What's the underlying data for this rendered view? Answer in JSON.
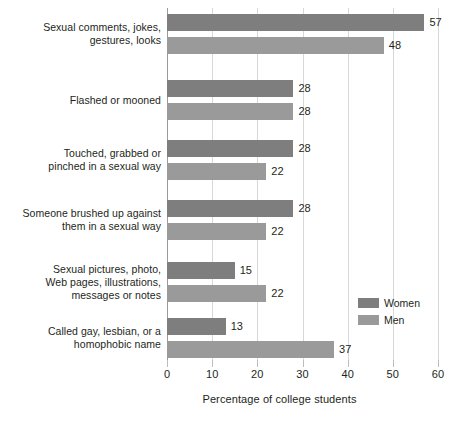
{
  "chart_data": {
    "type": "bar",
    "orientation": "horizontal",
    "title": "",
    "xlabel": "Percentage of college students",
    "ylabel": "",
    "xlim": [
      0,
      60
    ],
    "xticks": [
      0,
      10,
      20,
      30,
      40,
      50,
      60
    ],
    "grid": true,
    "legend_position": "center-right",
    "categories": [
      "Sexual comments, jokes, gestures, looks",
      "Flashed or mooned",
      "Touched, grabbed or pinched in a sexual way",
      "Someone brushed up against them in a sexual way",
      "Sexual pictures, photo, Web pages, illustrations, messages or notes",
      "Called gay, lesbian, or a homophobic name"
    ],
    "category_lines": [
      [
        "Sexual comments, jokes,",
        "gestures, looks"
      ],
      [
        "Flashed or mooned"
      ],
      [
        "Touched, grabbed or",
        "pinched in a sexual way"
      ],
      [
        "Someone brushed up against",
        "them in a sexual way"
      ],
      [
        "Sexual pictures, photo,",
        "Web pages, illustrations,",
        "messages or notes"
      ],
      [
        "Called gay, lesbian, or a",
        "homophobic name"
      ]
    ],
    "series": [
      {
        "name": "Women",
        "color": "#7e7e7e",
        "values": [
          57,
          28,
          28,
          28,
          15,
          13
        ]
      },
      {
        "name": "Men",
        "color": "#9a9a9a",
        "values": [
          48,
          28,
          22,
          22,
          22,
          37
        ]
      }
    ]
  },
  "legend": {
    "items": [
      {
        "label": "Women",
        "color": "#7e7e7e"
      },
      {
        "label": "Men",
        "color": "#9a9a9a"
      }
    ]
  },
  "axis": {
    "x_title": "Percentage of college students",
    "tick_labels": [
      "0",
      "10",
      "20",
      "30",
      "40",
      "50",
      "60"
    ]
  }
}
